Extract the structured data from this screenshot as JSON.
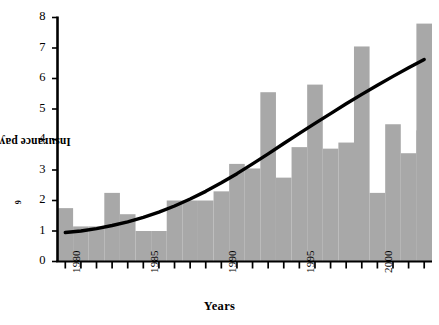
{
  "chart_data": {
    "type": "bar",
    "title": "",
    "xlabel": "Years",
    "ylabel": "Insurance payments, $10",
    "ylabel_exponent": "9",
    "ylim": [
      0,
      8
    ],
    "yticks": [
      0,
      1,
      2,
      3,
      4,
      5,
      6,
      7,
      8
    ],
    "ytick_labels": [
      "0",
      "1",
      "2",
      "3",
      "4",
      "5",
      "6",
      "7",
      "8"
    ],
    "xlim": [
      1979.5,
      2003.5
    ],
    "xtick_labels": [
      "1980",
      "1985",
      "1990",
      "1995",
      "2000"
    ],
    "xtick_values": [
      1980,
      1985,
      1990,
      1995,
      2000
    ],
    "grid": false,
    "legend": "none",
    "bar_color": "#a8a8a8",
    "line_color": "#000000",
    "axis_color": "#000000",
    "categories": [
      1980,
      1981,
      1982,
      1983,
      1984,
      1985,
      1986,
      1987,
      1988,
      1989,
      1990,
      1991,
      1992,
      1993,
      1994,
      1995,
      1996,
      1997,
      1998,
      1999,
      2000,
      2001,
      2002,
      2003
    ],
    "values": [
      1.75,
      1.15,
      1.15,
      2.25,
      1.55,
      1.0,
      1.0,
      2.0,
      2.0,
      2.0,
      2.3,
      3.2,
      3.05,
      5.55,
      2.75,
      3.75,
      5.8,
      3.7,
      3.9,
      7.05,
      2.25,
      4.5,
      3.55,
      4.3
    ],
    "final_value": 7.8,
    "trend": {
      "name": "trend curve",
      "x": [
        1980,
        1981,
        1982,
        1983,
        1984,
        1985,
        1986,
        1987,
        1988,
        1989,
        1990,
        1991,
        1992,
        1993,
        1994,
        1995,
        1996,
        1997,
        1998,
        1999,
        2000,
        2001,
        2002,
        2003
      ],
      "y": [
        0.95,
        1.0,
        1.08,
        1.18,
        1.3,
        1.45,
        1.62,
        1.82,
        2.05,
        2.3,
        2.58,
        2.88,
        3.2,
        3.53,
        3.87,
        4.2,
        4.53,
        4.85,
        5.17,
        5.48,
        5.78,
        6.07,
        6.35,
        6.62
      ]
    }
  }
}
